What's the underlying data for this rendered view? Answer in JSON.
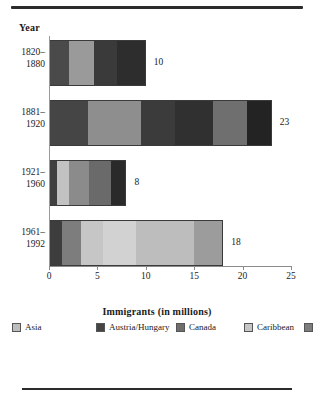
{
  "figure": {
    "year_header": "Year",
    "xaxis_title": "Immigrants (in millions)"
  },
  "chart_data": {
    "type": "bar",
    "orientation": "horizontal",
    "stacked": true,
    "title": "",
    "xlabel": "Immigrants (in millions)",
    "ylabel": "Year",
    "xlim": [
      0,
      25
    ],
    "xticks": [
      0,
      5,
      10,
      15,
      20,
      25
    ],
    "xticklabels": [
      "0",
      "5",
      "10",
      "15",
      "20",
      "25"
    ],
    "grid": false,
    "legend_position": "bottom",
    "categories": [
      "1820–1880",
      "1881–1920",
      "1921–1960",
      "1961–1992"
    ],
    "totals": [
      10,
      23,
      8,
      18
    ],
    "total_labels": [
      "10",
      "23",
      "8",
      "18"
    ],
    "bars": [
      {
        "period": "1820–1880",
        "total": 10,
        "segments": [
          {
            "label": "Ireland",
            "value": 2.0,
            "color": "#4a4a4a"
          },
          {
            "label": "Germany",
            "value": 2.6,
            "color": "#9a9a9a"
          },
          {
            "label": "Other Europe",
            "value": 2.5,
            "color": "#3a3a3a"
          },
          {
            "label": "All other",
            "value": 2.9,
            "color": "#2d2d2d"
          }
        ]
      },
      {
        "period": "1881–1920",
        "total": 23,
        "segments": [
          {
            "label": "Austria/Hungary",
            "value": 4.0,
            "color": "#454545"
          },
          {
            "label": "Italy",
            "value": 5.5,
            "color": "#8e8e8e"
          },
          {
            "label": "Soviet Union",
            "value": 3.5,
            "color": "#3b3b3b"
          },
          {
            "label": "Germany",
            "value": 4.0,
            "color": "#303030"
          },
          {
            "label": "UK",
            "value": 3.5,
            "color": "#6f6f6f"
          },
          {
            "label": "All other",
            "value": 2.5,
            "color": "#232323"
          }
        ]
      },
      {
        "period": "1921–1960",
        "total": 8,
        "segments": [
          {
            "label": "Canada",
            "value": 0.7,
            "color": "#3f3f3f"
          },
          {
            "label": "Mexico",
            "value": 1.3,
            "color": "#c2c2c2"
          },
          {
            "label": "Europe",
            "value": 2.1,
            "color": "#8b8b8b"
          },
          {
            "label": "Other Europe",
            "value": 2.4,
            "color": "#6a6a6a"
          },
          {
            "label": "All other",
            "value": 1.5,
            "color": "#2a2a2a"
          }
        ]
      },
      {
        "period": "1961–1992",
        "total": 18,
        "segments": [
          {
            "label": "Canada",
            "value": 1.3,
            "color": "#3d3d3d"
          },
          {
            "label": "Central/S. America",
            "value": 1.9,
            "color": "#7d7d7d"
          },
          {
            "label": "Caribbean",
            "value": 2.3,
            "color": "#c6c6c6"
          },
          {
            "label": "Mexico",
            "value": 3.5,
            "color": "#d2d2d2"
          },
          {
            "label": "Asia",
            "value": 6.0,
            "color": "#bdbdbd"
          },
          {
            "label": "All other",
            "value": 3.0,
            "color": "#9c9c9c"
          }
        ]
      }
    ],
    "legend": [
      {
        "label": "Asia",
        "color": "#bdbdbd"
      },
      {
        "label": "Austria/Hungary",
        "color": "#454545"
      },
      {
        "label": "Canada",
        "color": "#6e6e6e"
      },
      {
        "label": "Caribbean",
        "color": "#c6c6c6"
      },
      {
        "label": "Central/S. America",
        "color": "#7d7d7d"
      },
      {
        "label": "Europe",
        "color": "#a8a8a8"
      },
      {
        "label": "Germany",
        "color": "#303030"
      },
      {
        "label": "Ireland",
        "color": "#252525"
      },
      {
        "label": "Italy",
        "color": "#111111"
      },
      {
        "label": "Mexico",
        "color": "#d8d8d8"
      },
      {
        "label": "Soviet Union",
        "color": "#3b3b3b"
      },
      {
        "label": "UK",
        "color": "#6f6f6f"
      },
      {
        "label": "All other",
        "color": "#2d2d2d"
      },
      {
        "label": "Other Europe",
        "color": "#5f5f5f"
      }
    ]
  }
}
